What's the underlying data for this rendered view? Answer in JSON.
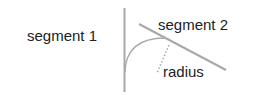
{
  "diagram": {
    "labels": {
      "segment1": "segment 1",
      "segment2": "segment 2",
      "radius": "radius"
    },
    "colors": {
      "line": "#a8a8a8",
      "text": "#222222",
      "dotted": "#a8a8a8"
    }
  }
}
